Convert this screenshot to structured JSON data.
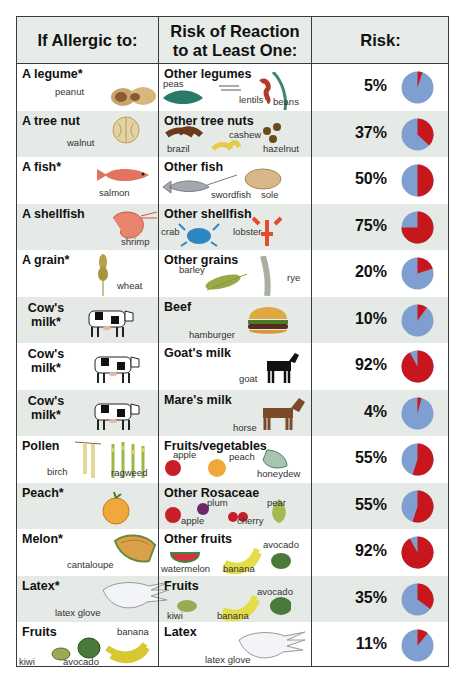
{
  "header": {
    "col1": "If Allergic to:",
    "col2_line1": "Risk of Reaction",
    "col2_line2": "to at Least One:",
    "col3": "Risk:"
  },
  "colors": {
    "risk": "#c8161d",
    "no_risk": "#7e9fd0",
    "shade": "#e6eae6",
    "border": "#3a3a3a"
  },
  "rows": [
    {
      "allergen": "A legume*",
      "allergen_items": [
        "peanut"
      ],
      "related": "Other legumes",
      "related_items": [
        "peas",
        "lentils",
        "beans"
      ],
      "risk": "5%",
      "value": 5
    },
    {
      "allergen": "A tree nut",
      "allergen_items": [
        "walnut"
      ],
      "related": "Other tree nuts",
      "related_items": [
        "brazil",
        "cashew",
        "hazelnut"
      ],
      "risk": "37%",
      "value": 37
    },
    {
      "allergen": "A fish*",
      "allergen_items": [
        "salmon"
      ],
      "related": "Other fish",
      "related_items": [
        "swordfish",
        "sole"
      ],
      "risk": "50%",
      "value": 50
    },
    {
      "allergen": "A shellfish",
      "allergen_items": [
        "shrimp"
      ],
      "related": "Other shellfish",
      "related_items": [
        "crab",
        "lobster"
      ],
      "risk": "75%",
      "value": 75
    },
    {
      "allergen": "A grain*",
      "allergen_items": [
        "wheat"
      ],
      "related": "Other grains",
      "related_items": [
        "barley",
        "rye"
      ],
      "risk": "20%",
      "value": 20
    },
    {
      "allergen": "Cow's milk*",
      "allergen_items": [],
      "related": "Beef",
      "related_items": [
        "hamburger"
      ],
      "risk": "10%",
      "value": 10
    },
    {
      "allergen": "Cow's milk*",
      "allergen_items": [],
      "related": "Goat's milk",
      "related_items": [
        "goat"
      ],
      "risk": "92%",
      "value": 92
    },
    {
      "allergen": "Cow's milk*",
      "allergen_items": [],
      "related": "Mare's milk",
      "related_items": [
        "horse"
      ],
      "risk": "4%",
      "value": 4
    },
    {
      "allergen": "Pollen",
      "allergen_items": [
        "birch",
        "ragweed"
      ],
      "related": "Fruits/vegetables",
      "related_items": [
        "apple",
        "peach",
        "honeydew"
      ],
      "risk": "55%",
      "value": 55
    },
    {
      "allergen": "Peach*",
      "allergen_items": [],
      "related": "Other Rosaceae",
      "related_items": [
        "plum",
        "pear",
        "apple",
        "cherry"
      ],
      "risk": "55%",
      "value": 55
    },
    {
      "allergen": "Melon*",
      "allergen_items": [
        "cantaloupe"
      ],
      "related": "Other fruits",
      "related_items": [
        "avocado",
        "watermelon",
        "banana"
      ],
      "risk": "92%",
      "value": 92
    },
    {
      "allergen": "Latex*",
      "allergen_items": [
        "latex glove"
      ],
      "related": "Fruits",
      "related_items": [
        "avocado",
        "kiwi",
        "banana"
      ],
      "risk": "35%",
      "value": 35
    },
    {
      "allergen": "Fruits",
      "allergen_items": [
        "banana",
        "kiwi",
        "avocado"
      ],
      "related": "Latex",
      "related_items": [
        "latex glove"
      ],
      "risk": "11%",
      "value": 11
    }
  ],
  "chart_data": {
    "type": "pie",
    "columns": [
      "If Allergic to:",
      "Risk of Reaction to at Least One:",
      "Risk:"
    ],
    "categories": [
      "A legume* → Other legumes",
      "A tree nut → Other tree nuts",
      "A fish* → Other fish",
      "A shellfish → Other shellfish",
      "A grain* → Other grains",
      "Cow's milk* → Beef",
      "Cow's milk* → Goat's milk",
      "Cow's milk* → Mare's milk",
      "Pollen → Fruits/vegetables",
      "Peach* → Other Rosaceae",
      "Melon* → Other fruits",
      "Latex* → Fruits",
      "Fruits → Latex"
    ],
    "values": [
      5,
      37,
      50,
      75,
      20,
      10,
      92,
      4,
      55,
      55,
      92,
      35,
      11
    ],
    "unit": "%",
    "legend": {
      "risk_color": "#c8161d",
      "remainder_color": "#7e9fd0"
    }
  }
}
